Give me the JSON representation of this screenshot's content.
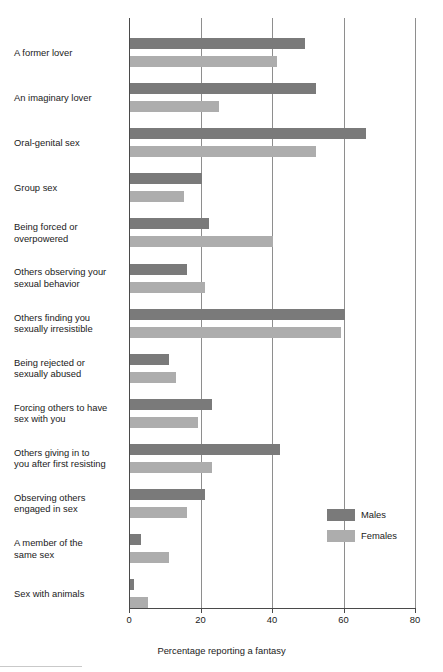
{
  "chart_data": {
    "type": "bar",
    "orientation": "horizontal",
    "title": "",
    "xlabel": "Percentage reporting a fantasy",
    "ylabel": "",
    "xlim": [
      0,
      80
    ],
    "xticks": [
      0,
      20,
      40,
      60,
      80
    ],
    "xtick_labels": [
      "0",
      "20",
      "40",
      "60",
      "80"
    ],
    "grid": "vertical",
    "legend_position": "inside-right",
    "categories": [
      "A former lover",
      "An imaginary lover",
      "Oral-genital sex",
      "Group sex",
      "Being forced or overpowered",
      "Others observing your sexual behavior",
      "Others finding you sexually irresistible",
      "Being rejected or sexually abused",
      "Forcing others to have sex with you",
      "Others giving in to you after first resisting",
      "Observing others engaged in sex",
      "A member of the same sex",
      "Sex with animals"
    ],
    "category_lines": [
      [
        "A former lover"
      ],
      [
        "An imaginary lover"
      ],
      [
        "Oral-genital sex"
      ],
      [
        "Group sex"
      ],
      [
        "Being forced or",
        "overpowered"
      ],
      [
        "Others observing your",
        "sexual behavior"
      ],
      [
        "Others finding you",
        "sexually irresistible"
      ],
      [
        "Being rejected or",
        "sexually abused"
      ],
      [
        "Forcing others to have",
        "sex with you"
      ],
      [
        "Others giving in to",
        "you after first resisting"
      ],
      [
        "Observing others",
        "engaged in sex"
      ],
      [
        "A member of the",
        "same sex"
      ],
      [
        "Sex with animals"
      ]
    ],
    "series": [
      {
        "name": "Males",
        "color": "#7a7a7a",
        "values": [
          49,
          52,
          66,
          20,
          22,
          16,
          60,
          11,
          23,
          42,
          21,
          3,
          1
        ]
      },
      {
        "name": "Females",
        "color": "#adadad",
        "values": [
          41,
          25,
          52,
          15,
          40,
          21,
          59,
          13,
          19,
          23,
          16,
          11,
          5
        ]
      }
    ]
  },
  "legend": {
    "items": [
      {
        "label": "Males",
        "color": "#7a7a7a"
      },
      {
        "label": "Females",
        "color": "#adadad"
      }
    ]
  },
  "axis": {
    "x_title": "Percentage reporting a fantasy",
    "tick_labels": [
      "0",
      "20",
      "40",
      "60",
      "80"
    ]
  }
}
